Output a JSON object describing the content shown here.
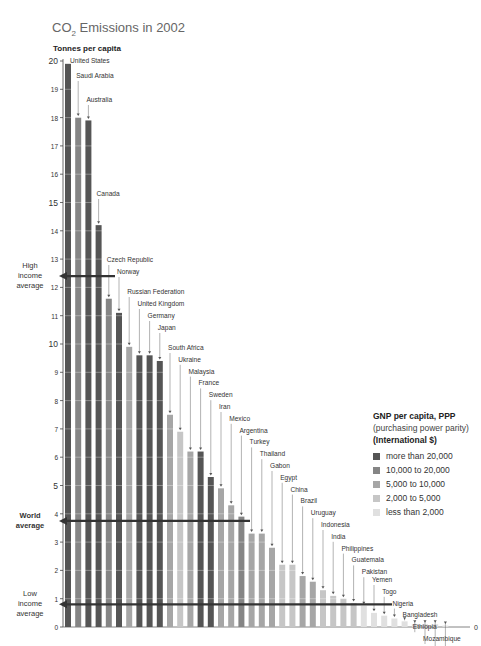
{
  "header": {
    "title_prefix": "CO",
    "title_sub": "2",
    "title_suffix": " Emissions in 2002",
    "ylabel": "Tonnes per capita"
  },
  "legend": {
    "title": "GNP per capita, PPP",
    "subtitle": "(purchasing power parity)",
    "unit": "(International $)",
    "items": [
      {
        "label": "more than 20,000",
        "color": "#555555"
      },
      {
        "label": "10,000 to 20,000",
        "color": "#858585"
      },
      {
        "label": "5,000 to 10,000",
        "color": "#a6a6a6"
      },
      {
        "label": "2,000 to 5,000",
        "color": "#c6c6c6"
      },
      {
        "label": "less than 2,000",
        "color": "#e0e0e0"
      }
    ]
  },
  "averages": [
    {
      "label": [
        "High",
        "income",
        "average"
      ],
      "value": 12.4,
      "bold": false
    },
    {
      "label": [
        "World",
        "average"
      ],
      "value": 3.75,
      "bold": true
    },
    {
      "label": [
        "Low",
        "income",
        "average"
      ],
      "value": 0.8,
      "bold": false
    }
  ],
  "chart_data": {
    "type": "bar",
    "title": "CO2 Emissions in 2002",
    "xlabel": "",
    "ylabel": "Tonnes per capita",
    "ylim": [
      0,
      20
    ],
    "yticks": [
      0,
      1,
      2,
      3,
      4,
      5,
      6,
      7,
      8,
      9,
      10,
      11,
      12,
      13,
      14,
      15,
      16,
      17,
      18,
      19,
      20
    ],
    "grid": true,
    "legend_position": "right",
    "categories": [
      "United States",
      "Saudi Arabia",
      "Australia",
      "Canada",
      "Czech Republic",
      "Norway",
      "Russian Federation",
      "United Kingdom",
      "Germany",
      "Japan",
      "South Africa",
      "Ukraine",
      "Malaysia",
      "France",
      "Sweden",
      "Iran",
      "Mexico",
      "Argentina",
      "Turkey",
      "Thailand",
      "Gabon",
      "Egypt",
      "China",
      "Brazil",
      "Uruguay",
      "Indonesia",
      "India",
      "Philippines",
      "Guatemala",
      "Pakistan",
      "Yemen",
      "Togo",
      "Nigeria",
      "Bangladesh",
      "Ethiopia",
      "Mozambique",
      "Uganda",
      "Mali"
    ],
    "values": [
      19.9,
      18.0,
      17.9,
      14.2,
      11.6,
      11.1,
      9.9,
      9.6,
      9.6,
      9.4,
      7.5,
      6.9,
      6.2,
      6.2,
      5.3,
      4.9,
      4.3,
      3.9,
      3.3,
      3.3,
      2.8,
      2.2,
      2.2,
      1.8,
      1.6,
      1.3,
      1.1,
      1.0,
      0.85,
      0.75,
      0.5,
      0.4,
      0.3,
      0.2,
      0.1,
      0.1,
      0.1,
      0.05
    ],
    "income_group": [
      0,
      1,
      0,
      0,
      1,
      0,
      2,
      0,
      0,
      0,
      2,
      3,
      2,
      0,
      0,
      2,
      2,
      1,
      2,
      2,
      2,
      3,
      3,
      2,
      2,
      3,
      3,
      3,
      3,
      4,
      4,
      4,
      4,
      4,
      4,
      4,
      4,
      4
    ],
    "reference_lines": {
      "high_income_average": 12.4,
      "world_average": 3.75,
      "low_income_average": 0.8
    }
  }
}
